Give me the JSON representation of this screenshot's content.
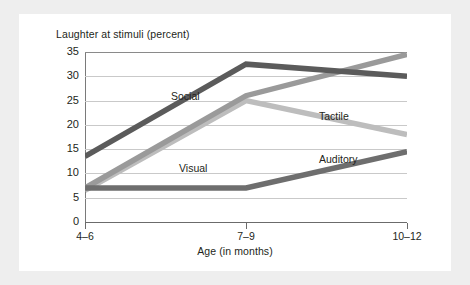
{
  "chart_data": {
    "type": "line",
    "title": "Laughter at stimuli (percent)",
    "xlabel": "Age (in months)",
    "ylabel": "",
    "categories": [
      "4–6",
      "7–9",
      "10–12"
    ],
    "ylim": [
      0,
      35
    ],
    "yticks": [
      0,
      5,
      10,
      15,
      20,
      25,
      30,
      35
    ],
    "ytick_labels": [
      "0",
      "5",
      "10",
      "15",
      "20",
      "25",
      "30",
      "35"
    ],
    "grid": true,
    "legend_position": "inline-annotations",
    "series": [
      {
        "name": "Social",
        "values": [
          13.5,
          32.5,
          30
        ],
        "color": "#5b5b5b"
      },
      {
        "name": "Tactile",
        "values": [
          7,
          26,
          34.5
        ],
        "color": "#9a9a9a"
      },
      {
        "name": "Visual",
        "values": [
          6.5,
          25,
          18
        ],
        "color": "#bdbdbd"
      },
      {
        "name": "Auditory",
        "values": [
          7,
          7,
          14.5
        ],
        "color": "#6e6e6e"
      }
    ],
    "annotations": [
      "Social",
      "Tactile",
      "Visual",
      "Auditory"
    ]
  },
  "figure": {
    "background": "#ffffff",
    "page_background": "#eeeeee",
    "gridline_color": "#c9c9c9",
    "axis_color": "#6b6b6b"
  }
}
